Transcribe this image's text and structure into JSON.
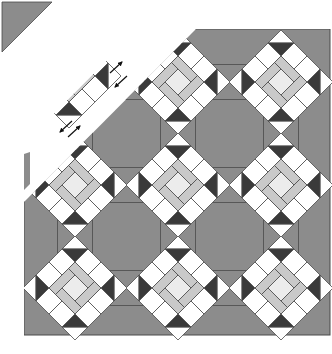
{
  "diagram": {
    "canvas": {
      "width": 332,
      "height": 354
    },
    "colors": {
      "background": "#ffffff",
      "medium_gray": "#8c8c8c",
      "dark": "#3a3a3a",
      "light_gray": "#c9c9c9",
      "center": "#ececec",
      "white": "#ffffff",
      "line": "#4a4a4a"
    },
    "quilt_body": {
      "x": 24,
      "y": 29,
      "width": 306,
      "height": 306
    },
    "block": {
      "half_diagonal": 52
    },
    "hourglass": {
      "half_size": 17.5
    },
    "blocks": [
      {
        "row": 1,
        "col": 1,
        "cx": 75,
        "cy": 82,
        "detached": true
      },
      {
        "row": 1,
        "col": 2,
        "cx": 178,
        "cy": 82
      },
      {
        "row": 1,
        "col": 3,
        "cx": 281,
        "cy": 82
      },
      {
        "row": 2,
        "col": 1,
        "cx": 75,
        "cy": 185
      },
      {
        "row": 2,
        "col": 2,
        "cx": 178,
        "cy": 185
      },
      {
        "row": 2,
        "col": 3,
        "cx": 281,
        "cy": 185
      },
      {
        "row": 3,
        "col": 1,
        "cx": 75,
        "cy": 288
      },
      {
        "row": 3,
        "col": 2,
        "cx": 178,
        "cy": 288
      },
      {
        "row": 3,
        "col": 3,
        "cx": 281,
        "cy": 288
      }
    ],
    "sashing_hourglasses": [
      {
        "cx": 127,
        "cy": 82,
        "orientation": "horizontal"
      },
      {
        "cx": 229,
        "cy": 82,
        "orientation": "horizontal"
      },
      {
        "cx": 127,
        "cy": 185,
        "orientation": "horizontal"
      },
      {
        "cx": 229,
        "cy": 185,
        "orientation": "horizontal"
      },
      {
        "cx": 127,
        "cy": 288,
        "orientation": "horizontal"
      },
      {
        "cx": 229,
        "cy": 288,
        "orientation": "horizontal"
      },
      {
        "cx": 75,
        "cy": 133,
        "orientation": "vertical"
      },
      {
        "cx": 178,
        "cy": 133,
        "orientation": "vertical"
      },
      {
        "cx": 281,
        "cy": 133,
        "orientation": "vertical"
      },
      {
        "cx": 75,
        "cy": 236,
        "orientation": "vertical"
      },
      {
        "cx": 178,
        "cy": 236,
        "orientation": "vertical"
      },
      {
        "cx": 281,
        "cy": 236,
        "orientation": "vertical"
      }
    ],
    "seam_gap": {
      "description": "white diagonal gap separating the first diagonal row from the rest of the quilt",
      "points": "0,168 160,0 186,0 186,28 24,190 24,180 0,205",
      "corner_gap": "0,160 0,205 50,155 ... "
    },
    "arrows": [
      {
        "name": "arrow-pair-upper",
        "x": 117,
        "y": 74,
        "label": "join direction arrows"
      },
      {
        "name": "arrow-pair-lower",
        "x": 68,
        "y": 123,
        "label": "join direction arrows"
      }
    ],
    "corner_triangle": {
      "points": "2,2 50,2 2,50",
      "label": "setting triangle corner"
    }
  }
}
